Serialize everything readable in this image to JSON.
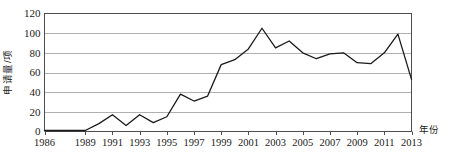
{
  "chart_data": {
    "type": "line",
    "title": "",
    "xlabel": "年份",
    "ylabel": "申请量/项",
    "x": [
      1986,
      1987,
      1988,
      1989,
      1990,
      1991,
      1992,
      1993,
      1994,
      1995,
      1996,
      1997,
      1998,
      1999,
      2000,
      2001,
      2002,
      2003,
      2004,
      2005,
      2006,
      2007,
      2008,
      2009,
      2010,
      2011,
      2012,
      2013
    ],
    "values": [
      1,
      1,
      1,
      1,
      8,
      17,
      6,
      17,
      9,
      15,
      38,
      31,
      36,
      68,
      73,
      84,
      105,
      85,
      92,
      80,
      74,
      79,
      80,
      70,
      69,
      80,
      99,
      53
    ],
    "series": [
      {
        "name": "申请量",
        "values": [
          1,
          1,
          1,
          1,
          8,
          17,
          6,
          17,
          9,
          15,
          38,
          31,
          36,
          68,
          73,
          84,
          105,
          85,
          92,
          80,
          74,
          79,
          80,
          70,
          69,
          80,
          99,
          53
        ]
      }
    ],
    "xtick_labels": [
      "1986",
      "1989",
      "1991",
      "1993",
      "1995",
      "1997",
      "1999",
      "2001",
      "2003",
      "2005",
      "2007",
      "2009",
      "2011",
      "2013"
    ],
    "xtick_values": [
      1986,
      1989,
      1991,
      1993,
      1995,
      1997,
      1999,
      2001,
      2003,
      2005,
      2007,
      2009,
      2011,
      2013
    ],
    "ytick_labels": [
      "0",
      "20",
      "40",
      "60",
      "80",
      "100",
      "120"
    ],
    "ytick_values": [
      0,
      20,
      40,
      60,
      80,
      100,
      120
    ],
    "ylim": [
      0,
      120
    ],
    "xlim": [
      1986,
      2013
    ],
    "grid": "horizontal",
    "legend": "none",
    "line_color": "#1a1a1a",
    "grid_color": "#b0b0b0",
    "axis_color": "#4d4d4d",
    "background_color": "#ffffff"
  }
}
